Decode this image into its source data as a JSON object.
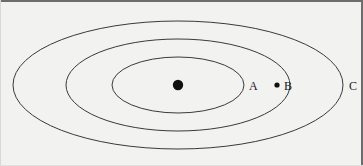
{
  "figure": {
    "background_color": "#f2f2f1",
    "stroke_color": "#3a3a3a",
    "frame_color": "#6d6d6d",
    "width": 363,
    "height": 166,
    "center": {
      "x": 178,
      "y": 85
    }
  },
  "center_point": {
    "name": "center-dot",
    "x": 178,
    "y": 85,
    "radius": 5.2,
    "fill": "#101010"
  },
  "ellipses": [
    {
      "id": "inner",
      "label": "A",
      "cx": 178,
      "cy": 85,
      "rx": 66,
      "ry": 28
    },
    {
      "id": "middle",
      "label": "B",
      "cx": 178,
      "cy": 85,
      "rx": 112,
      "ry": 46
    },
    {
      "id": "outer",
      "label": "C",
      "cx": 178,
      "cy": 85,
      "rx": 165,
      "ry": 64
    }
  ],
  "labels": [
    {
      "id": "label-a",
      "text": "A",
      "x": 249,
      "y": 80
    },
    {
      "id": "label-b",
      "text": "B",
      "x": 284,
      "y": 80
    },
    {
      "id": "label-c",
      "text": "C",
      "x": 349,
      "y": 80
    }
  ],
  "points": [
    {
      "id": "point-b",
      "label": "B",
      "x": 277,
      "y": 85,
      "radius": 2.6,
      "fill": "#101010",
      "on_ellipse": "middle"
    }
  ]
}
